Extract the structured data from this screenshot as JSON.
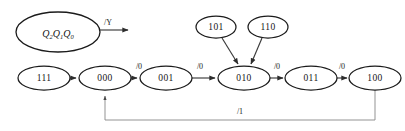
{
  "diagram": {
    "type": "state-transition-diagram",
    "background_color": "#ffffff",
    "stroke_color": "#1b1b1b",
    "edge_color": "#3a3a3a",
    "legend": {
      "state_variable_text": "Q",
      "subscripts": [
        "2",
        "1",
        "0"
      ],
      "output_label": "/Y"
    },
    "states": [
      {
        "id": "s111",
        "label": "111",
        "cx": 44,
        "cy": 78,
        "rx": 26,
        "ry": 12
      },
      {
        "id": "s000",
        "label": "000",
        "cx": 105,
        "cy": 78,
        "rx": 26,
        "ry": 12
      },
      {
        "id": "s001",
        "label": "001",
        "cx": 166,
        "cy": 78,
        "rx": 26,
        "ry": 12
      },
      {
        "id": "s010",
        "label": "010",
        "cx": 244,
        "cy": 78,
        "rx": 26,
        "ry": 12
      },
      {
        "id": "s011",
        "label": "011",
        "cx": 311,
        "cy": 78,
        "rx": 26,
        "ry": 12
      },
      {
        "id": "s100",
        "label": "100",
        "cx": 375,
        "cy": 78,
        "rx": 26,
        "ry": 12
      },
      {
        "id": "s101",
        "label": "101",
        "cx": 216,
        "cy": 27,
        "rx": 20,
        "ry": 11
      },
      {
        "id": "s110",
        "label": "110",
        "cx": 268,
        "cy": 27,
        "rx": 20,
        "ry": 11
      }
    ],
    "transitions": [
      {
        "from": "s111",
        "to": "s000",
        "label": ""
      },
      {
        "from": "s000",
        "to": "s001",
        "label": "/0"
      },
      {
        "from": "s001",
        "to": "s010",
        "label": "/0"
      },
      {
        "from": "s010",
        "to": "s011",
        "label": "/0"
      },
      {
        "from": "s011",
        "to": "s100",
        "label": "/0"
      },
      {
        "from": "s101",
        "to": "s010",
        "label": ""
      },
      {
        "from": "s110",
        "to": "s010",
        "label": ""
      },
      {
        "from": "s100",
        "to": "s000",
        "label": "/1"
      }
    ],
    "edge_labels": {
      "t000_001": "/0",
      "t001_010": "/0",
      "t010_011": "/0",
      "t011_100": "/0",
      "feedback": "/1"
    }
  }
}
